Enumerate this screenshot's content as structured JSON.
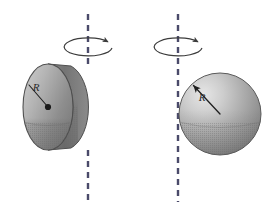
{
  "figure": {
    "background_color": "#ffffff",
    "width": 265,
    "height": 220,
    "panels": [
      {
        "id": "left-panel",
        "object_name": "rotating-disk",
        "object_type": "disk",
        "description": "Thin disk rotating about a vertical axis through its center (in the plane of the disk)",
        "radius_label": "R",
        "axis": {
          "name": "rotation-axis",
          "orientation": "vertical",
          "style": "dashed",
          "x": 88,
          "y_top": 14,
          "y_bottom": 202,
          "color": "#4a4a6a",
          "dash": "6 5",
          "width": 2.4
        },
        "rotation_arrow": {
          "name": "rotation-direction-arrow",
          "cx": 88,
          "cy": 48,
          "rx": 24,
          "ry": 9,
          "color": "#3c3c3c",
          "direction": "counterclockwise-viewed-from-top"
        },
        "body": {
          "cx": 48,
          "cy": 107,
          "face_rx": 25,
          "face_ry": 43,
          "thickness": 23,
          "fill_light": "#c9c9c9",
          "fill_mid": "#9c9c9c",
          "fill_dark": "#6e6e6e",
          "stroke": "#4f4f4f"
        },
        "center_dot": {
          "name": "center-of-mass-dot",
          "cx": 48,
          "cy": 107,
          "r": 3.1,
          "color": "#1a1a1a"
        },
        "radius_indicator": {
          "name": "radius-line",
          "x1": 48,
          "y1": 107,
          "x2": 29,
          "y2": 85,
          "color": "#1f1f1f",
          "width": 1.1,
          "arrow": false,
          "label_x": 36,
          "label_y": 91
        }
      },
      {
        "id": "right-panel",
        "object_name": "rotating-sphere",
        "object_type": "sphere",
        "description": "Solid sphere rotating about a vertical axis tangent to its surface",
        "radius_label": "R",
        "axis": {
          "name": "rotation-axis",
          "orientation": "vertical",
          "style": "dashed",
          "x": 178,
          "y_top": 14,
          "y_bottom": 202,
          "color": "#4a4a6a",
          "dash": "6 5",
          "width": 2.4
        },
        "rotation_arrow": {
          "name": "rotation-direction-arrow",
          "cx": 178,
          "cy": 48,
          "rx": 24,
          "ry": 9,
          "color": "#3c3c3c",
          "direction": "counterclockwise-viewed-from-top"
        },
        "body": {
          "cx": 220,
          "cy": 114,
          "r": 41,
          "fill_light": "#d6d6d6",
          "fill_mid": "#a8a8a8",
          "fill_dark": "#787878",
          "stroke": "#5a5a5a",
          "highlight_x": 198,
          "highlight_y": 92
        },
        "radius_indicator": {
          "name": "radius-arrow",
          "x1": 220,
          "y1": 114,
          "x2": 192,
          "y2": 84,
          "color": "#1f1f1f",
          "width": 1.3,
          "arrow": true,
          "label_x": 201,
          "label_y": 100
        }
      }
    ]
  }
}
